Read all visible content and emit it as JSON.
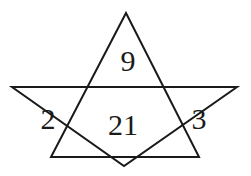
{
  "figure": {
    "background_color": "#ffffff",
    "stroke_color": "#1a1a1a",
    "stroke_width": 2,
    "label_color": "#1a1a1a",
    "shapes": [
      {
        "name": "upward-triangle",
        "points": "126,13 199,157 51,157"
      },
      {
        "name": "downward-triangle",
        "points": "12,87 237,87 124,166"
      }
    ],
    "regions": [
      {
        "name": "top-region",
        "value": "9",
        "x": 128,
        "y": 61
      },
      {
        "name": "left-region",
        "value": "2",
        "x": 48,
        "y": 119
      },
      {
        "name": "center-region",
        "value": "21",
        "x": 123,
        "y": 125
      },
      {
        "name": "right-region",
        "value": "3",
        "x": 199,
        "y": 119
      }
    ]
  }
}
